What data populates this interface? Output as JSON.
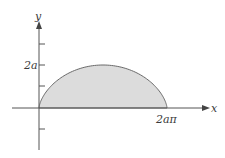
{
  "figure": {
    "x_axis_label": "x",
    "y_axis_label": "y",
    "y_tick_label": "2a",
    "x_tick_label": "2aπ",
    "colors": {
      "fill": "#dcdcdc",
      "curve": "#6a6a6a",
      "axis": "#555555",
      "text": "#3a3a3a"
    }
  },
  "chart_data": {
    "type": "area",
    "title": "",
    "xlabel": "x",
    "ylabel": "y",
    "curve": "cycloid arch",
    "x_ticks": [
      "2aπ"
    ],
    "y_ticks": [
      "2a"
    ],
    "x_range": [
      0,
      "2aπ"
    ],
    "y_max": "2a"
  }
}
